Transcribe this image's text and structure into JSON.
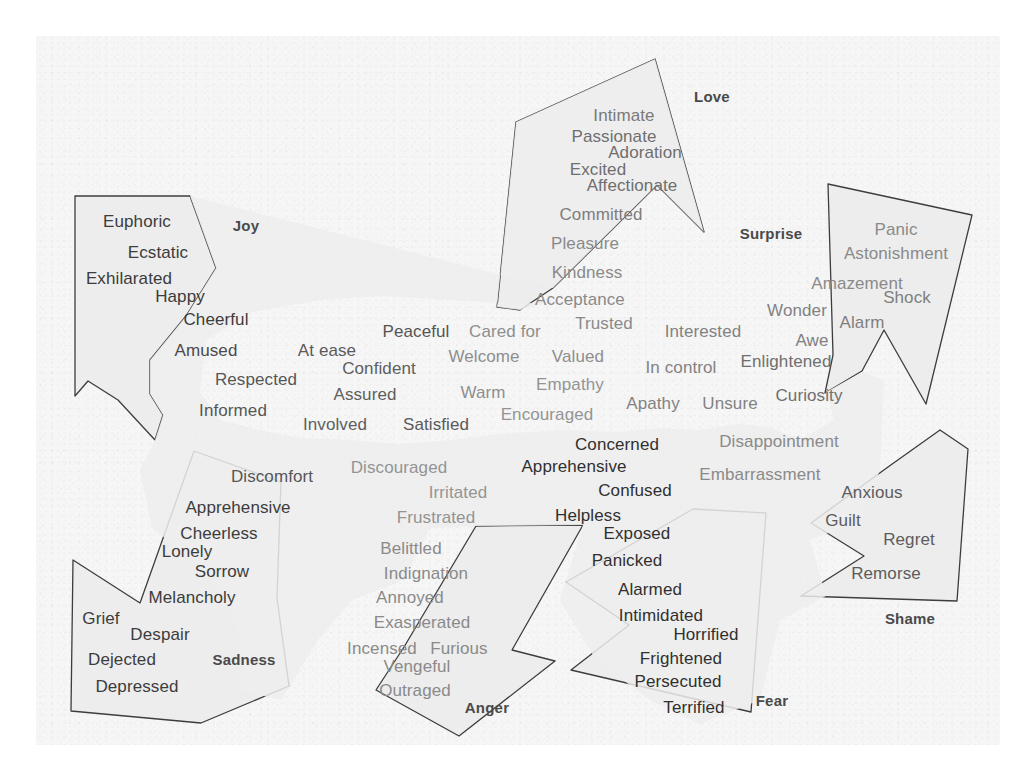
{
  "diagram": {
    "type": "emotion-wheel-diagram",
    "background_color": "#f6f6f6",
    "fill_color": "#ededed",
    "stroke_color": "#3d3d3d"
  },
  "categories": [
    {
      "id": "joy",
      "label": "Joy",
      "x": 246,
      "y": 225,
      "size": 15
    },
    {
      "id": "love",
      "label": "Love",
      "x": 712,
      "y": 96,
      "size": 15
    },
    {
      "id": "surprise",
      "label": "Surprise",
      "x": 771,
      "y": 233,
      "size": 15
    },
    {
      "id": "shame",
      "label": "Shame",
      "x": 910,
      "y": 618,
      "size": 15
    },
    {
      "id": "fear",
      "label": "Fear",
      "x": 772,
      "y": 700,
      "size": 15
    },
    {
      "id": "anger",
      "label": "Anger",
      "x": 487,
      "y": 707,
      "size": 15
    },
    {
      "id": "sadness",
      "label": "Sadness",
      "x": 244,
      "y": 659,
      "size": 15
    }
  ],
  "words": [
    {
      "text": "Euphoric",
      "x": 137,
      "y": 221,
      "size": 17,
      "color": "#3c3c3c",
      "group": "joy"
    },
    {
      "text": "Ecstatic",
      "x": 158,
      "y": 252,
      "size": 17,
      "color": "#3c3c3c",
      "group": "joy"
    },
    {
      "text": "Exhilarated",
      "x": 129,
      "y": 278,
      "size": 17,
      "color": "#3c3c3c",
      "group": "joy"
    },
    {
      "text": "Happy",
      "x": 180,
      "y": 296,
      "size": 17,
      "color": "#3c3c3c",
      "group": "joy"
    },
    {
      "text": "Cheerful",
      "x": 216,
      "y": 319,
      "size": 17,
      "color": "#3c3c3c",
      "group": "joy"
    },
    {
      "text": "Amused",
      "x": 206,
      "y": 350,
      "size": 17,
      "color": "#4b4b4b",
      "group": "joy"
    },
    {
      "text": "Respected",
      "x": 256,
      "y": 379,
      "size": 17,
      "color": "#565656",
      "group": "joy"
    },
    {
      "text": "Informed",
      "x": 233,
      "y": 410,
      "size": 17,
      "color": "#565656",
      "group": "joy"
    },
    {
      "text": "At ease",
      "x": 327,
      "y": 350,
      "size": 17,
      "color": "#5a5a5a",
      "group": "center"
    },
    {
      "text": "Confident",
      "x": 379,
      "y": 368,
      "size": 17,
      "color": "#5e5e5e",
      "group": "center"
    },
    {
      "text": "Assured",
      "x": 365,
      "y": 394,
      "size": 17,
      "color": "#5e5e5e",
      "group": "center"
    },
    {
      "text": "Involved",
      "x": 335,
      "y": 424,
      "size": 17,
      "color": "#5e5e5e",
      "group": "center"
    },
    {
      "text": "Satisfied",
      "x": 436,
      "y": 424,
      "size": 17,
      "color": "#5a5a5a",
      "group": "center"
    },
    {
      "text": "Peaceful",
      "x": 416,
      "y": 331,
      "size": 17,
      "color": "#555555",
      "group": "center"
    },
    {
      "text": "Cared for",
      "x": 505,
      "y": 331,
      "size": 17,
      "color": "#8e8e8e",
      "group": "center"
    },
    {
      "text": "Trusted",
      "x": 604,
      "y": 323,
      "size": 17,
      "color": "#8a8a8a",
      "group": "center"
    },
    {
      "text": "Welcome",
      "x": 484,
      "y": 356,
      "size": 17,
      "color": "#8e8e8e",
      "group": "center"
    },
    {
      "text": "Valued",
      "x": 578,
      "y": 356,
      "size": 17,
      "color": "#8e8e8e",
      "group": "center"
    },
    {
      "text": "Warm",
      "x": 483,
      "y": 392,
      "size": 17,
      "color": "#8e8e8e",
      "group": "center"
    },
    {
      "text": "Empathy",
      "x": 570,
      "y": 384,
      "size": 17,
      "color": "#949494",
      "group": "center"
    },
    {
      "text": "Encouraged",
      "x": 547,
      "y": 414,
      "size": 17,
      "color": "#949494",
      "group": "center"
    },
    {
      "text": "Interested",
      "x": 703,
      "y": 331,
      "size": 17,
      "color": "#828282",
      "group": "center"
    },
    {
      "text": "In control",
      "x": 681,
      "y": 367,
      "size": 17,
      "color": "#828282",
      "group": "center"
    },
    {
      "text": "Apathy",
      "x": 653,
      "y": 403,
      "size": 17,
      "color": "#828282",
      "group": "center"
    },
    {
      "text": "Unsure",
      "x": 730,
      "y": 403,
      "size": 17,
      "color": "#828282",
      "group": "center"
    },
    {
      "text": "Intimate",
      "x": 624,
      "y": 115,
      "size": 17,
      "color": "#797979",
      "group": "love"
    },
    {
      "text": "Passionate",
      "x": 614,
      "y": 136,
      "size": 17,
      "color": "#6f6f6f",
      "group": "love"
    },
    {
      "text": "Adoration",
      "x": 645,
      "y": 152,
      "size": 17,
      "color": "#6f6f6f",
      "group": "love"
    },
    {
      "text": "Excited",
      "x": 598,
      "y": 169,
      "size": 17,
      "color": "#6f6f6f",
      "group": "love"
    },
    {
      "text": "Affectionate",
      "x": 632,
      "y": 185,
      "size": 17,
      "color": "#6f6f6f",
      "group": "love"
    },
    {
      "text": "Committed",
      "x": 601,
      "y": 214,
      "size": 17,
      "color": "#7d7d7d",
      "group": "love"
    },
    {
      "text": "Pleasure",
      "x": 585,
      "y": 243,
      "size": 17,
      "color": "#8a8a8a",
      "group": "love"
    },
    {
      "text": "Kindness",
      "x": 587,
      "y": 272,
      "size": 17,
      "color": "#8a8a8a",
      "group": "love"
    },
    {
      "text": "Acceptance",
      "x": 580,
      "y": 299,
      "size": 17,
      "color": "#8a8a8a",
      "group": "love"
    },
    {
      "text": "Panic",
      "x": 896,
      "y": 229,
      "size": 17,
      "color": "#8a8a8a",
      "group": "surprise"
    },
    {
      "text": "Astonishment",
      "x": 896,
      "y": 253,
      "size": 17,
      "color": "#8a8a8a",
      "group": "surprise"
    },
    {
      "text": "Amazement",
      "x": 857,
      "y": 283,
      "size": 17,
      "color": "#8a8a8a",
      "group": "surprise"
    },
    {
      "text": "Shock",
      "x": 907,
      "y": 297,
      "size": 17,
      "color": "#7f7f7f",
      "group": "surprise"
    },
    {
      "text": "Wonder",
      "x": 797,
      "y": 310,
      "size": 17,
      "color": "#828282",
      "group": "surprise"
    },
    {
      "text": "Alarm",
      "x": 862,
      "y": 322,
      "size": 17,
      "color": "#7f7f7f",
      "group": "surprise"
    },
    {
      "text": "Awe",
      "x": 812,
      "y": 340,
      "size": 17,
      "color": "#7f7f7f",
      "group": "surprise"
    },
    {
      "text": "Enlightened",
      "x": 786,
      "y": 361,
      "size": 17,
      "color": "#6f6f6f",
      "group": "surprise"
    },
    {
      "text": "Curiosity",
      "x": 809,
      "y": 395,
      "size": 17,
      "color": "#6f6f6f",
      "group": "surprise"
    },
    {
      "text": "Concerned",
      "x": 617,
      "y": 444,
      "size": 17,
      "color": "#303030",
      "group": "fear"
    },
    {
      "text": "Apprehensive",
      "x": 574,
      "y": 466,
      "size": 17,
      "color": "#303030",
      "group": "fear"
    },
    {
      "text": "Confused",
      "x": 635,
      "y": 490,
      "size": 17,
      "color": "#303030",
      "group": "fear"
    },
    {
      "text": "Helpless",
      "x": 588,
      "y": 515,
      "size": 17,
      "color": "#303030",
      "group": "fear"
    },
    {
      "text": "Exposed",
      "x": 637,
      "y": 533,
      "size": 17,
      "color": "#303030",
      "group": "fear"
    },
    {
      "text": "Panicked",
      "x": 627,
      "y": 560,
      "size": 17,
      "color": "#303030",
      "group": "fear"
    },
    {
      "text": "Alarmed",
      "x": 650,
      "y": 589,
      "size": 17,
      "color": "#303030",
      "group": "fear"
    },
    {
      "text": "Intimidated",
      "x": 661,
      "y": 615,
      "size": 17,
      "color": "#303030",
      "group": "fear"
    },
    {
      "text": "Horrified",
      "x": 706,
      "y": 634,
      "size": 17,
      "color": "#303030",
      "group": "fear"
    },
    {
      "text": "Frightened",
      "x": 681,
      "y": 658,
      "size": 17,
      "color": "#303030",
      "group": "fear"
    },
    {
      "text": "Persecuted",
      "x": 678,
      "y": 681,
      "size": 17,
      "color": "#303030",
      "group": "fear"
    },
    {
      "text": "Terrified",
      "x": 694,
      "y": 707,
      "size": 17,
      "color": "#303030",
      "group": "fear"
    },
    {
      "text": "Disappointment",
      "x": 779,
      "y": 441,
      "size": 17,
      "color": "#8a8a8a",
      "group": "shame"
    },
    {
      "text": "Embarrassment",
      "x": 760,
      "y": 474,
      "size": 17,
      "color": "#8a8a8a",
      "group": "shame"
    },
    {
      "text": "Anxious",
      "x": 872,
      "y": 492,
      "size": 17,
      "color": "#5c5c5c",
      "group": "shame"
    },
    {
      "text": "Guilt",
      "x": 843,
      "y": 520,
      "size": 17,
      "color": "#5c5c5c",
      "group": "shame"
    },
    {
      "text": "Regret",
      "x": 909,
      "y": 539,
      "size": 17,
      "color": "#5c5c5c",
      "group": "shame"
    },
    {
      "text": "Remorse",
      "x": 886,
      "y": 573,
      "size": 17,
      "color": "#5c5c5c",
      "group": "shame"
    },
    {
      "text": "Discomfort",
      "x": 272,
      "y": 476,
      "size": 17,
      "color": "#565656",
      "group": "sadness"
    },
    {
      "text": "Apprehensive",
      "x": 238,
      "y": 507,
      "size": 17,
      "color": "#3c3c3c",
      "group": "sadness"
    },
    {
      "text": "Cheerless",
      "x": 219,
      "y": 533,
      "size": 17,
      "color": "#3c3c3c",
      "group": "sadness"
    },
    {
      "text": "Lonely",
      "x": 187,
      "y": 551,
      "size": 17,
      "color": "#3c3c3c",
      "group": "sadness"
    },
    {
      "text": "Sorrow",
      "x": 222,
      "y": 571,
      "size": 17,
      "color": "#3c3c3c",
      "group": "sadness"
    },
    {
      "text": "Melancholy",
      "x": 192,
      "y": 597,
      "size": 17,
      "color": "#3c3c3c",
      "group": "sadness"
    },
    {
      "text": "Grief",
      "x": 101,
      "y": 618,
      "size": 17,
      "color": "#3c3c3c",
      "group": "sadness"
    },
    {
      "text": "Despair",
      "x": 160,
      "y": 634,
      "size": 17,
      "color": "#3c3c3c",
      "group": "sadness"
    },
    {
      "text": "Dejected",
      "x": 122,
      "y": 659,
      "size": 17,
      "color": "#3c3c3c",
      "group": "sadness"
    },
    {
      "text": "Depressed",
      "x": 137,
      "y": 686,
      "size": 17,
      "color": "#3c3c3c",
      "group": "sadness"
    },
    {
      "text": "Discouraged",
      "x": 399,
      "y": 467,
      "size": 17,
      "color": "#949494",
      "group": "anger"
    },
    {
      "text": "Irritated",
      "x": 458,
      "y": 492,
      "size": 17,
      "color": "#949494",
      "group": "anger"
    },
    {
      "text": "Frustrated",
      "x": 436,
      "y": 517,
      "size": 17,
      "color": "#949494",
      "group": "anger"
    },
    {
      "text": "Belittled",
      "x": 411,
      "y": 548,
      "size": 17,
      "color": "#8a8a8a",
      "group": "anger"
    },
    {
      "text": "Indignation",
      "x": 426,
      "y": 573,
      "size": 17,
      "color": "#8a8a8a",
      "group": "anger"
    },
    {
      "text": "Annoyed",
      "x": 410,
      "y": 597,
      "size": 17,
      "color": "#8a8a8a",
      "group": "anger"
    },
    {
      "text": "Exasperated",
      "x": 422,
      "y": 622,
      "size": 17,
      "color": "#8a8a8a",
      "group": "anger"
    },
    {
      "text": "Incensed",
      "x": 382,
      "y": 648,
      "size": 17,
      "color": "#8a8a8a",
      "group": "anger"
    },
    {
      "text": "Furious",
      "x": 459,
      "y": 648,
      "size": 17,
      "color": "#8a8a8a",
      "group": "anger"
    },
    {
      "text": "Vengeful",
      "x": 417,
      "y": 666,
      "size": 17,
      "color": "#8a8a8a",
      "group": "anger"
    },
    {
      "text": "Outraged",
      "x": 415,
      "y": 690,
      "size": 17,
      "color": "#8a8a8a",
      "group": "anger"
    }
  ],
  "shapes": [
    {
      "id": "joy-shape",
      "points": "75,196 190,196 216,268 186,316 150,360 150,394 163,415 155,440 118,400 88,381 75,396"
    },
    {
      "id": "love-shape",
      "points": "516,122 655,59 704,232 657,185 553,288 520,310 497,307"
    },
    {
      "id": "surprise-shape",
      "points": "828,184 972,215 926,404 884,330 862,371 825,393 833,355"
    },
    {
      "id": "shame-shape",
      "points": "940,430 968,449 957,601 801,596 864,556 811,523 888,467"
    },
    {
      "id": "fear-shape",
      "points": "693,509 766,513 751,712 571,670 629,625 566,582"
    },
    {
      "id": "anger-shape",
      "points": "476,526 583,525 512,650 555,661 459,736 376,690 404,647"
    },
    {
      "id": "sadness-shape",
      "points": "194,451 281,482 277,598 289,686 201,723 71,711 73,560 140,603"
    },
    {
      "id": "center-cloud",
      "points": "190,196 216,268 186,316 150,360 150,394 163,415 155,440 140,470 152,528 196,562 232,612 244,664 238,690 281,700 318,640 352,600 404,580 430,528 476,526 583,525 560,600 596,660 650,700 700,724 760,700 780,620 826,596 810,540 862,520 880,470 884,380 862,372 826,392 834,420 800,440 772,428 740,424 700,430 660,428 620,432 560,430 500,434 452,440 400,444 352,440 300,438 260,430 220,420 200,392 206,340 252,312 320,300 380,296 450,300 520,304 560,300 520,310 497,307 516,122 655,59 704,232 657,185 553,288"
    }
  ]
}
